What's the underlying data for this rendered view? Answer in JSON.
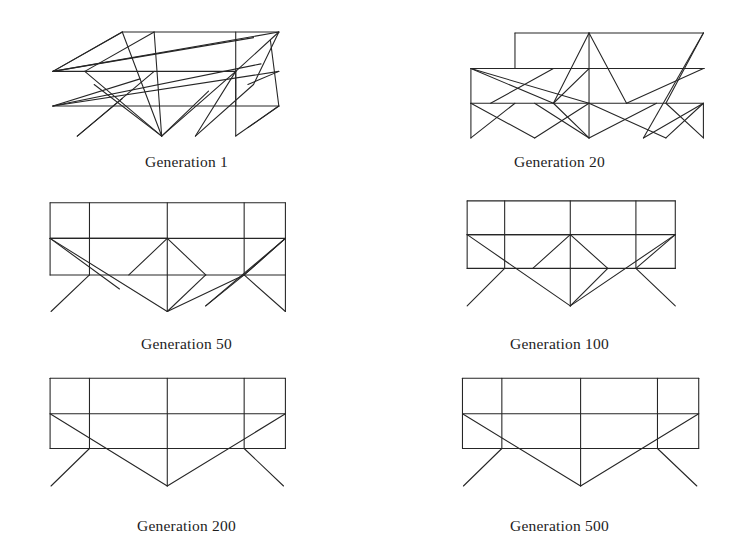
{
  "figure": {
    "background_color": "#ffffff",
    "line_color": "#262626",
    "caption_color": "#1d1d1d",
    "layout": {
      "columns": 2,
      "rows": 3,
      "width": 746,
      "height": 547
    }
  },
  "panels": [
    {
      "id": "generation-1",
      "caption": "Generation 1",
      "position": {
        "left": 0,
        "top": 2,
        "width": 373,
        "height": 182
      },
      "viewbox": "0 0 373 160",
      "caption_offset": 1,
      "truss": {
        "description": "Highly disordered truss with many crossing members",
        "segments": [
          [
            118,
            32,
            285,
            32
          ],
          [
            44,
            74,
            239,
            74
          ],
          [
            44,
            111,
            285,
            111
          ],
          [
            118,
            32,
            44,
            74
          ],
          [
            152,
            32,
            78,
            74
          ],
          [
            285,
            32,
            239,
            74
          ],
          [
            44,
            74,
            118,
            32
          ],
          [
            239,
            74,
            239,
            143
          ],
          [
            239,
            32,
            239,
            111
          ],
          [
            44,
            74,
            285,
            32
          ],
          [
            44,
            74,
            258,
            38
          ],
          [
            44,
            111,
            285,
            74
          ],
          [
            44,
            111,
            266,
            66
          ],
          [
            118,
            32,
            160,
            143
          ],
          [
            152,
            32,
            160,
            143
          ],
          [
            78,
            74,
            160,
            143
          ],
          [
            160,
            143,
            239,
            74
          ],
          [
            160,
            143,
            210,
            95
          ],
          [
            239,
            74,
            196,
            143
          ],
          [
            196,
            143,
            258,
            88
          ],
          [
            258,
            88,
            285,
            32
          ],
          [
            285,
            111,
            239,
            143
          ],
          [
            285,
            111,
            252,
            134
          ],
          [
            70,
            143,
            152,
            74
          ],
          [
            70,
            143,
            118,
            103
          ],
          [
            44,
            111,
            137,
            82
          ],
          [
            88,
            88,
            160,
            143
          ],
          [
            285,
            74,
            252,
            88
          ],
          [
            276,
            41,
            285,
            111
          ]
        ]
      }
    },
    {
      "id": "generation-20",
      "caption": "Generation 20",
      "position": {
        "left": 373,
        "top": 2,
        "width": 373,
        "height": 182
      },
      "viewbox": "0 0 373 160",
      "caption_offset": 1,
      "truss": {
        "description": "Partially ordered truss, top bay offset to the right",
        "segments": [
          [
            139,
            33,
            340,
            33
          ],
          [
            139,
            33,
            139,
            71
          ],
          [
            92,
            71,
            341,
            71
          ],
          [
            92,
            71,
            92,
            108
          ],
          [
            92,
            108,
            340,
            108
          ],
          [
            340,
            108,
            340,
            145
          ],
          [
            92,
            108,
            92,
            145
          ],
          [
            218,
            71,
            218,
            145
          ],
          [
            218,
            33,
            218,
            71
          ],
          [
            218,
            33,
            180,
            108
          ],
          [
            218,
            33,
            258,
            108
          ],
          [
            340,
            33,
            300,
            108
          ],
          [
            340,
            33,
            276,
            145
          ],
          [
            92,
            71,
            180,
            108
          ],
          [
            92,
            71,
            218,
            108
          ],
          [
            113,
            108,
            180,
            71
          ],
          [
            92,
            108,
            160,
            145
          ],
          [
            180,
            108,
            218,
            145
          ],
          [
            218,
            145,
            160,
            108
          ],
          [
            218,
            145,
            290,
            108
          ],
          [
            218,
            108,
            300,
            145
          ],
          [
            258,
            108,
            340,
            71
          ],
          [
            276,
            145,
            340,
            108
          ],
          [
            300,
            108,
            340,
            145
          ],
          [
            92,
            145,
            139,
            108
          ],
          [
            160,
            145,
            218,
            108
          ],
          [
            218,
            71,
            180,
            108
          ],
          [
            300,
            145,
            340,
            108
          ]
        ]
      }
    },
    {
      "id": "generation-50",
      "caption": "Generation 50",
      "position": {
        "left": 0,
        "top": 184,
        "width": 373,
        "height": 182
      },
      "viewbox": "0 0 373 160",
      "caption_offset": 1,
      "truss": {
        "description": "Mostly regular two-bay frame with a few stray diagonals",
        "segments": [
          [
            41,
            20,
            292,
            20
          ],
          [
            41,
            20,
            41,
            97
          ],
          [
            292,
            20,
            292,
            97
          ],
          [
            41,
            58,
            292,
            58
          ],
          [
            41,
            97,
            292,
            97
          ],
          [
            83,
            20,
            83,
            97
          ],
          [
            166,
            20,
            166,
            136
          ],
          [
            248,
            20,
            248,
            97
          ],
          [
            41,
            58,
            166,
            58
          ],
          [
            41,
            58,
            166,
            136
          ],
          [
            41,
            58,
            115,
            112
          ],
          [
            166,
            58,
            125,
            97
          ],
          [
            166,
            58,
            207,
            97
          ],
          [
            166,
            136,
            207,
            97
          ],
          [
            166,
            136,
            248,
            97
          ],
          [
            83,
            97,
            42,
            136
          ],
          [
            248,
            97,
            292,
            136
          ],
          [
            292,
            58,
            248,
            97
          ],
          [
            292,
            58,
            207,
            130
          ],
          [
            248,
            97,
            292,
            58
          ],
          [
            207,
            130,
            248,
            97
          ],
          [
            292,
            97,
            292,
            136
          ]
        ]
      }
    },
    {
      "id": "generation-100",
      "caption": "Generation 100",
      "position": {
        "left": 373,
        "top": 184,
        "width": 373,
        "height": 182
      },
      "viewbox": "0 0 373 160",
      "caption_offset": 1,
      "truss": {
        "description": "Regular frame, symmetric V bracing, four verticals",
        "segments": [
          [
            88,
            18,
            310,
            18
          ],
          [
            88,
            18,
            88,
            90
          ],
          [
            310,
            18,
            310,
            90
          ],
          [
            88,
            54,
            310,
            54
          ],
          [
            88,
            90,
            310,
            90
          ],
          [
            128,
            18,
            128,
            90
          ],
          [
            198,
            18,
            198,
            130
          ],
          [
            268,
            18,
            268,
            90
          ],
          [
            88,
            54,
            198,
            54
          ],
          [
            88,
            54,
            198,
            130
          ],
          [
            198,
            54,
            158,
            90
          ],
          [
            198,
            54,
            238,
            90
          ],
          [
            198,
            130,
            238,
            90
          ],
          [
            198,
            130,
            310,
            54
          ],
          [
            128,
            90,
            88,
            130
          ],
          [
            268,
            90,
            310,
            130
          ],
          [
            310,
            54,
            268,
            90
          ]
        ]
      }
    },
    {
      "id": "generation-200",
      "caption": "Generation 200",
      "position": {
        "left": 0,
        "top": 366,
        "width": 373,
        "height": 181
      },
      "viewbox": "0 0 373 160",
      "caption_offset": 1,
      "truss": {
        "description": "Clean converged frame, single V brace",
        "segments": [
          [
            41,
            13,
            292,
            13
          ],
          [
            41,
            13,
            41,
            88
          ],
          [
            292,
            13,
            292,
            88
          ],
          [
            41,
            51,
            292,
            51
          ],
          [
            41,
            88,
            292,
            88
          ],
          [
            83,
            13,
            83,
            88
          ],
          [
            166,
            13,
            166,
            128
          ],
          [
            248,
            13,
            248,
            88
          ],
          [
            41,
            51,
            166,
            128
          ],
          [
            166,
            128,
            292,
            51
          ],
          [
            83,
            88,
            42,
            128
          ],
          [
            248,
            88,
            290,
            128
          ]
        ]
      }
    },
    {
      "id": "generation-500",
      "caption": "Generation 500",
      "position": {
        "left": 373,
        "top": 366,
        "width": 373,
        "height": 181
      },
      "viewbox": "0 0 373 160",
      "caption_offset": 1,
      "truss": {
        "description": "Final converged symmetric frame",
        "segments": [
          [
            83,
            13,
            335,
            13
          ],
          [
            83,
            13,
            83,
            88
          ],
          [
            335,
            13,
            335,
            88
          ],
          [
            83,
            51,
            335,
            51
          ],
          [
            83,
            88,
            335,
            88
          ],
          [
            125,
            13,
            125,
            88
          ],
          [
            209,
            13,
            209,
            128
          ],
          [
            291,
            13,
            291,
            88
          ],
          [
            83,
            51,
            209,
            128
          ],
          [
            209,
            128,
            335,
            51
          ],
          [
            125,
            88,
            84,
            128
          ],
          [
            291,
            88,
            333,
            128
          ]
        ]
      }
    }
  ]
}
